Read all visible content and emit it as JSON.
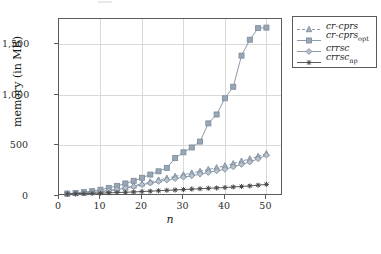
{
  "chart_data": {
    "type": "line",
    "title": "",
    "xlabel": "n",
    "ylabel": "memory (in MB)",
    "xlim": [
      0,
      54
    ],
    "ylim": [
      0,
      1750
    ],
    "xticks": [
      0,
      10,
      20,
      30,
      40,
      50
    ],
    "xticklabels": [
      "0",
      "10",
      "20",
      "30",
      "40",
      "50"
    ],
    "yticks": [
      0,
      500,
      1000,
      1500
    ],
    "yticklabels": [
      "0",
      "500",
      "1,000",
      "1,500"
    ],
    "grid": true,
    "legend_position": "top-right-outside",
    "x": [
      2,
      4,
      6,
      8,
      10,
      12,
      14,
      16,
      18,
      20,
      22,
      24,
      26,
      28,
      30,
      32,
      34,
      36,
      38,
      40,
      42,
      44,
      46,
      48,
      50
    ],
    "series": [
      {
        "name": "cr-cprs",
        "marker": "triangle",
        "linestyle": "dashed",
        "color": "#7f8fa0",
        "values": [
          22,
          26,
          30,
          36,
          44,
          55,
          68,
          84,
          100,
          120,
          140,
          158,
          176,
          194,
          210,
          228,
          244,
          262,
          280,
          298,
          320,
          345,
          368,
          392,
          418
        ]
      },
      {
        "name": "cr-cprs_opt",
        "label_base": "cr-cprs",
        "label_sub": "opt",
        "marker": "square",
        "linestyle": "solid",
        "color": "#7f8fa0",
        "values": [
          24,
          30,
          38,
          48,
          62,
          80,
          100,
          124,
          150,
          180,
          212,
          244,
          278,
          375,
          432,
          480,
          538,
          718,
          806,
          966,
          1080,
          1388,
          1545,
          1660,
          1665
        ]
      },
      {
        "name": "crrsc",
        "marker": "diamond",
        "linestyle": "solid",
        "color": "#7f8fa0",
        "values": [
          22,
          26,
          30,
          35,
          42,
          52,
          64,
          78,
          94,
          112,
          128,
          144,
          158,
          172,
          186,
          200,
          216,
          232,
          248,
          264,
          288,
          312,
          336,
          368,
          405
        ]
      },
      {
        "name": "crrsc_np",
        "label_base": "crrsc",
        "label_sub": "np",
        "marker": "plus",
        "linestyle": "solid",
        "color": "#4a4a4a",
        "values": [
          20,
          22,
          24,
          26,
          28,
          31,
          34,
          37,
          40,
          44,
          48,
          52,
          56,
          60,
          64,
          68,
          72,
          76,
          80,
          84,
          89,
          94,
          100,
          107,
          115
        ]
      }
    ]
  },
  "legend": {
    "items": [
      {
        "label": "cr-cprs",
        "sub": ""
      },
      {
        "label": "cr-cprs",
        "sub": "opt"
      },
      {
        "label": "crrsc",
        "sub": ""
      },
      {
        "label": "crrsc",
        "sub": "np"
      }
    ]
  },
  "colors": {
    "series_gray": "#7f8fa0",
    "series_dark": "#4a4a4a",
    "grid": "#d9d9d9",
    "frame": "#5b5b5b",
    "text": "#1c1c1c"
  }
}
